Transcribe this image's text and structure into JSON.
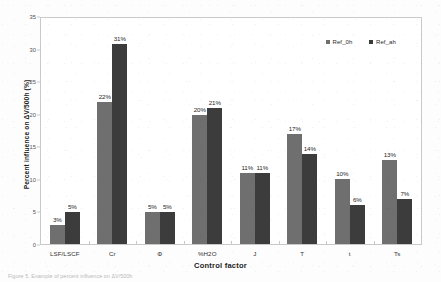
{
  "chart_data": {
    "type": "bar",
    "title": "",
    "xlabel": "Control factor",
    "ylabel": "Percent influence on ΔV/500h (%)",
    "ylim": [
      0,
      35
    ],
    "yticks": [
      0,
      5,
      10,
      15,
      20,
      25,
      30,
      35
    ],
    "grid": false,
    "legend_position": "top-right",
    "categories": [
      "LSF/LSCF",
      "Cr",
      "Φ",
      "%H2O",
      "J",
      "T",
      "t",
      "Ts"
    ],
    "series": [
      {
        "name": "Ref_0h",
        "color": "#6f6f6f",
        "values": [
          3,
          22,
          5,
          20,
          11,
          17,
          10,
          13
        ],
        "labels": [
          "3%",
          "22%",
          "5%",
          "20%",
          "11%",
          "17%",
          "10%",
          "13%"
        ]
      },
      {
        "name": "Ref_ah",
        "color": "#3c3c3c",
        "values": [
          5,
          31,
          5,
          21,
          11,
          14,
          6,
          7
        ],
        "labels": [
          "5%",
          "31%",
          "5%",
          "21%",
          "11%",
          "14%",
          "6%",
          "7%"
        ]
      }
    ]
  },
  "legend": {
    "items": [
      {
        "label": "Ref_0h",
        "color": "#6f6f6f"
      },
      {
        "label": "Ref_ah",
        "color": "#3c3c3c"
      }
    ]
  },
  "axes": {
    "y_title": "Percent influence on ΔV/500h (%)",
    "x_title": "Control factor",
    "y_tick_labels": [
      "0",
      "5",
      "10",
      "15",
      "20",
      "25",
      "30",
      "35"
    ]
  },
  "caption": {
    "text": "Figure 5. Example of percent influence on ΔV/500h"
  }
}
